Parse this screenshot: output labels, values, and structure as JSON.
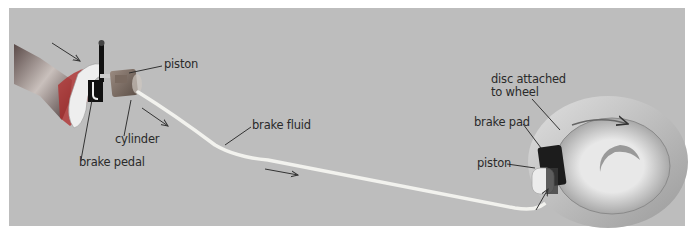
{
  "diagram": {
    "labels": {
      "piston_top": "piston",
      "cylinder": "cylinder",
      "brake_pedal": "brake pedal",
      "brake_fluid": "brake fluid",
      "disc_line1": "disc attached",
      "disc_line2": "to wheel",
      "brake_pad": "brake pad",
      "piston_bottom": "piston"
    },
    "colors": {
      "background": "#bdbdbd",
      "tube": "#f0f0ec",
      "disc": "#d8d8d8",
      "label": "#2a2a2a"
    }
  }
}
